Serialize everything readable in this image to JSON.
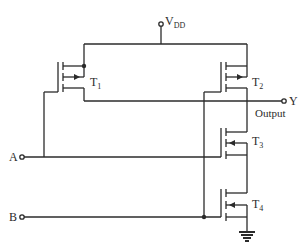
{
  "diagram": {
    "supply": {
      "label": "V",
      "subscript": "DD"
    },
    "inputs": [
      {
        "label": "A"
      },
      {
        "label": "B"
      }
    ],
    "output": {
      "label": "Y",
      "caption": "Output"
    },
    "transistors": [
      {
        "name": "T",
        "index": "1",
        "type": "pmos"
      },
      {
        "name": "T",
        "index": "2",
        "type": "pmos"
      },
      {
        "name": "T",
        "index": "3",
        "type": "nmos"
      },
      {
        "name": "T",
        "index": "4",
        "type": "nmos"
      }
    ],
    "colors": {
      "line": "#2b2b2b",
      "background": "#ffffff"
    }
  }
}
